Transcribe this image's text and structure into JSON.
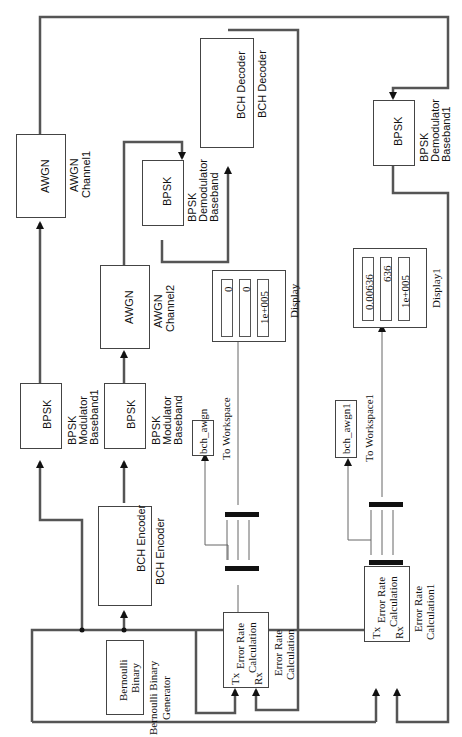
{
  "diagram": {
    "orientation": "rotated 90 degrees counter-clockwise",
    "line_color": "#555555",
    "blocks": {
      "bernoulli": {
        "icon_text_1": "Bernoulli",
        "icon_text_2": "Binary",
        "label_1": "Bernoulli Binary",
        "label_2": "Generator"
      },
      "bch_encoder": {
        "icon_text": "BCH Encoder",
        "label": "BCH Encoder"
      },
      "bpsk_mod": {
        "icon_text": "BPSK",
        "label_1": "BPSK",
        "label_2": "Modulator",
        "label_3": "Baseband"
      },
      "bpsk_mod1": {
        "icon_text": "BPSK",
        "label_1": "BPSK",
        "label_2": "Modulator",
        "label_3": "Baseband1"
      },
      "awgn1": {
        "icon_text": "AWGN",
        "label_1": "AWGN",
        "label_2": "Channel1"
      },
      "awgn2": {
        "icon_text": "AWGN",
        "label_1": "AWGN",
        "label_2": "Channel2"
      },
      "bpsk_demod": {
        "icon_text": "BPSK",
        "label_1": "BPSK",
        "label_2": "Demodulator",
        "label_3": "Baseband"
      },
      "bpsk_demod1": {
        "icon_text": "BPSK",
        "label_1": "BPSK",
        "label_2": "Demodulator",
        "label_3": "Baseband1"
      },
      "bch_decoder": {
        "icon_text": "BCH Decoder",
        "label": "BCH Decoder"
      },
      "err_rate": {
        "tx": "Tx",
        "rx": "Rx",
        "icon_text_1": "Error Rate",
        "icon_text_2": "Calculation",
        "label_1": "Error Rate",
        "label_2": "Calculation"
      },
      "err_rate1": {
        "tx": "Tx",
        "rx": "Rx",
        "icon_text_1": "Error Rate",
        "icon_text_2": "Calculation",
        "label_1": "Error Rate",
        "label_2": "Calculation1"
      },
      "to_ws": {
        "var": "bch_awgn",
        "label": "To Workspace"
      },
      "to_ws1": {
        "var": "bch_awgn1",
        "label": "To Workspace1"
      },
      "display": {
        "values": [
          "0",
          "0",
          "1e+005"
        ],
        "label": "Display"
      },
      "display1": {
        "values": [
          "0.00636",
          "636",
          "1e+005"
        ],
        "label": "Display1"
      }
    }
  }
}
